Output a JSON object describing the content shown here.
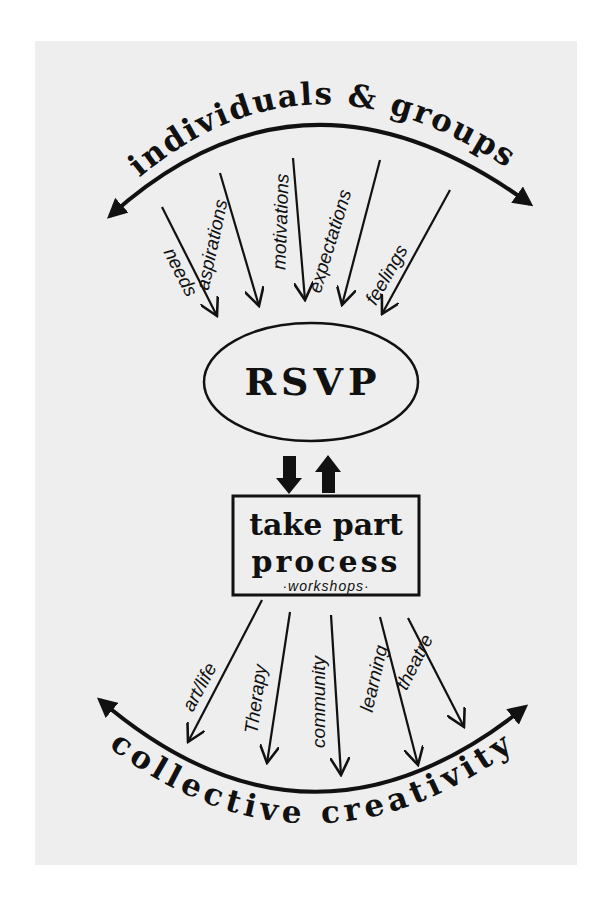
{
  "diagram": {
    "colors": {
      "background": "#ffffff",
      "card": "#eeeeee",
      "ink": "#111111"
    },
    "top_arc": {
      "label": "individuals & groups",
      "path": "M110,216 Q305,40 530,204",
      "text_path": "M115,200 Q305,15 535,188"
    },
    "inputs": [
      {
        "label": "needs",
        "x1": 162,
        "y1": 207,
        "x2": 217,
        "y2": 316,
        "tx": 175,
        "ty": 275,
        "rot": 63
      },
      {
        "label": "aspirations",
        "x1": 220,
        "y1": 173,
        "x2": 259,
        "y2": 306,
        "tx": 218,
        "ty": 246,
        "rot": -78
      },
      {
        "label": "motivations",
        "x1": 293,
        "y1": 158,
        "x2": 305,
        "y2": 300,
        "tx": 287,
        "ty": 222,
        "rot": -88
      },
      {
        "label": "expectations",
        "x1": 380,
        "y1": 160,
        "x2": 342,
        "y2": 305,
        "tx": 336,
        "ty": 243,
        "rot": -73
      },
      {
        "label": "feelings",
        "x1": 450,
        "y1": 190,
        "x2": 382,
        "y2": 314,
        "tx": 392,
        "ty": 278,
        "rot": -60
      }
    ],
    "center_node": {
      "label": "RSVP",
      "cx": 311,
      "cy": 382,
      "rx": 107,
      "ry": 59
    },
    "link_arrows": [
      {
        "direction": "down",
        "x": 289,
        "y1": 456,
        "y2": 494
      },
      {
        "direction": "up",
        "x": 328,
        "y1": 455,
        "y2": 493
      }
    ],
    "process_box": {
      "line1": "take part",
      "line2": "process",
      "line3": "·workshops·",
      "x": 233,
      "y": 496,
      "w": 186,
      "h": 99
    },
    "outputs": [
      {
        "label": "art/life",
        "x1": 262,
        "y1": 600,
        "x2": 188,
        "y2": 742,
        "tx": 205,
        "ty": 690,
        "rot": -62
      },
      {
        "label": "Therapy",
        "x1": 290,
        "y1": 612,
        "x2": 267,
        "y2": 763,
        "tx": 262,
        "ty": 700,
        "rot": -82
      },
      {
        "label": "community",
        "x1": 331,
        "y1": 615,
        "x2": 341,
        "y2": 775,
        "tx": 325,
        "ty": 702,
        "rot": -90
      },
      {
        "label": "learning",
        "x1": 380,
        "y1": 617,
        "x2": 418,
        "y2": 765,
        "tx": 380,
        "ty": 680,
        "rot": -77
      },
      {
        "label": "theatre",
        "x1": 408,
        "y1": 618,
        "x2": 464,
        "y2": 727,
        "tx": 420,
        "ty": 665,
        "rot": -63
      }
    ],
    "bottom_arc": {
      "label": "collective creativity",
      "path": "M100,700 Q310,880 525,707",
      "text_path": "M78,722 Q310,925 548,722"
    }
  }
}
